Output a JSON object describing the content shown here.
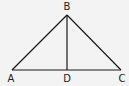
{
  "diagram": {
    "type": "triangle-with-altitude",
    "background": "#f3f3f3",
    "stroke_color": "#1a1a1a",
    "points": {
      "A": {
        "label": "A",
        "x": 12,
        "y": 70
      },
      "B": {
        "label": "B",
        "x": 67,
        "y": 15
      },
      "C": {
        "label": "C",
        "x": 121,
        "y": 70
      },
      "D": {
        "label": "D",
        "x": 67,
        "y": 70
      }
    },
    "segments": [
      {
        "from": "A",
        "to": "B"
      },
      {
        "from": "B",
        "to": "C"
      },
      {
        "from": "A",
        "to": "C"
      },
      {
        "from": "B",
        "to": "D"
      }
    ],
    "labels": {
      "A": "A",
      "B": "B",
      "C": "C",
      "D": "D"
    }
  }
}
